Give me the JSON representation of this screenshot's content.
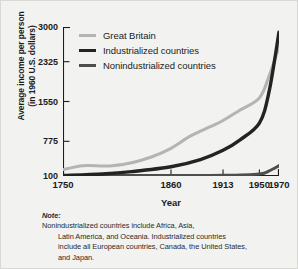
{
  "chart_data": {
    "type": "line",
    "title": "",
    "xlabel": "Year",
    "ylabel": "Average income per person (in 1960 U.S. dollars)",
    "ylabel_line1": "Average income per person",
    "ylabel_line2": "(in 1960 U.S. dollars)",
    "x": [
      1750,
      1860,
      1913,
      1950,
      1970
    ],
    "xtick_labels": [
      "1750",
      "1860",
      "1913",
      "1950",
      "1970"
    ],
    "ytick_labels": [
      "100",
      "775",
      "1550",
      "2325",
      "3000"
    ],
    "ytick_values": [
      100,
      775,
      1550,
      2325,
      3000
    ],
    "xlim": [
      1750,
      1970
    ],
    "ylim": [
      100,
      3000
    ],
    "grid": false,
    "legend_position": "top-left",
    "series": [
      {
        "name": "Great Britain",
        "color": "#b4b4b4",
        "width": 3.1,
        "x": [
          1750,
          1770,
          1790,
          1800,
          1820,
          1840,
          1860,
          1880,
          1900,
          1913,
          1930,
          1950,
          1960,
          1970
        ],
        "values": [
          225,
          300,
          295,
          300,
          360,
          470,
          640,
          880,
          1060,
          1180,
          1380,
          1620,
          2050,
          2620
        ]
      },
      {
        "name": "Industrialized countries",
        "color": "#232323",
        "width": 3.4,
        "x": [
          1750,
          1790,
          1820,
          1860,
          1890,
          1913,
          1930,
          1950,
          1960,
          1970
        ],
        "values": [
          110,
          140,
          185,
          280,
          420,
          600,
          800,
          1130,
          1750,
          2900
        ]
      },
      {
        "name": "Nonindustrialized countries",
        "color": "#4e4e4e",
        "width": 3.1,
        "x": [
          1750,
          1860,
          1913,
          1950,
          1960,
          1970
        ],
        "values": [
          105,
          108,
          112,
          140,
          200,
          300
        ]
      }
    ]
  },
  "note": {
    "label": "Note:",
    "lines": [
      "Nonindustrialized countries include Africa, Asia,",
      "Latin America, and Oceania. Industrialized countries",
      "include all European countries, Canada, the United States,",
      "and Japan."
    ],
    "text": "Note: Nonindustrialized countries include Africa, Asia, Latin America, and Oceania. Industrialized countries include all European countries, Canada, the United States, and Japan."
  },
  "colors": {
    "background": "#f2f2f0",
    "axis": "#1c1c1c",
    "text": "#1c1c1c"
  }
}
